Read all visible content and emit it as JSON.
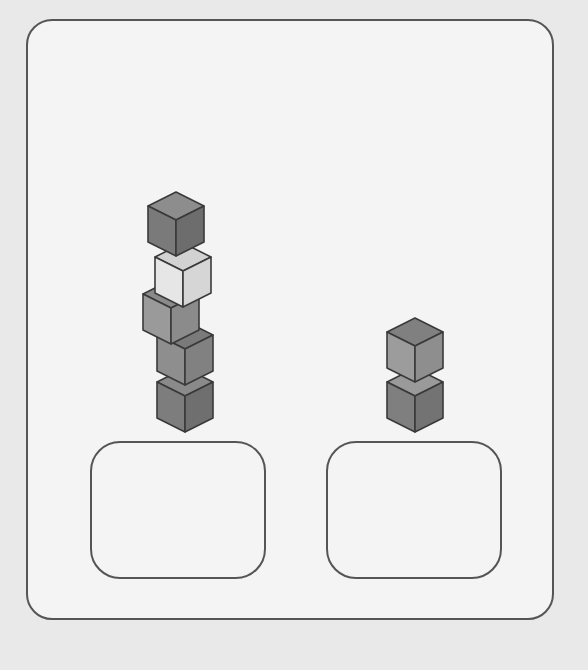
{
  "scene": {
    "description": "Two stacks of cubes above two empty answer boxes",
    "stacks": [
      {
        "name": "left-stack",
        "cube_count": 5,
        "cubes": [
          {
            "index": 0,
            "position": "bottom",
            "x": 157,
            "y": 368,
            "top": "#8a8a8a",
            "left": "#7d7d7d",
            "right": "#6f6f6f"
          },
          {
            "index": 1,
            "x": 157,
            "y": 321,
            "top": "#7a7a7a",
            "left": "#8e8e8e",
            "right": "#818181"
          },
          {
            "index": 2,
            "x": 143,
            "y": 280,
            "top": "#8a8a8a",
            "left": "#9a9a9a",
            "right": "#8b8b8b"
          },
          {
            "index": 3,
            "x": 155,
            "y": 243,
            "top": "#d2d2d2",
            "left": "#e6e6e6",
            "right": "#d6d6d6"
          },
          {
            "index": 4,
            "position": "top",
            "x": 148,
            "y": 192,
            "top": "#8d8d8d",
            "left": "#7a7a7a",
            "right": "#6d6d6d"
          }
        ]
      },
      {
        "name": "right-stack",
        "cube_count": 2,
        "cubes": [
          {
            "index": 0,
            "position": "bottom",
            "x": 387,
            "y": 368,
            "top": "#9a9a9a",
            "left": "#7f7f7f",
            "right": "#737373"
          },
          {
            "index": 1,
            "position": "top",
            "x": 387,
            "y": 318,
            "top": "#808080",
            "left": "#9c9c9c",
            "right": "#8e8e8e"
          }
        ]
      }
    ],
    "answer_boxes": [
      {
        "name": "left-answer-box",
        "value": ""
      },
      {
        "name": "right-answer-box",
        "value": ""
      }
    ],
    "colors": {
      "background": "#e9e9e9",
      "card": "#f4f4f4",
      "stroke": "#555555",
      "cube_edge": "#3a3a3a"
    }
  }
}
